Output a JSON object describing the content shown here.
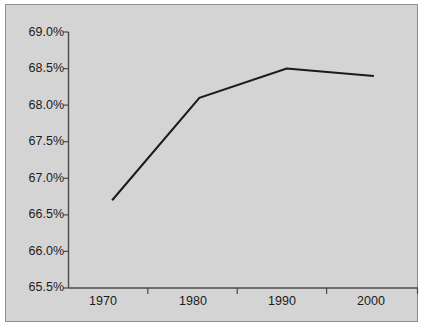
{
  "figure": {
    "background_color": "#ffffff",
    "panel_color": "#d4d4d4",
    "panel_border_color": "#8f8f8f",
    "title_partial": "",
    "axis_color": "#4a4a4a",
    "line_color": "#1a1a1a"
  },
  "chart_data": {
    "type": "line",
    "title": "",
    "xlabel": "",
    "ylabel": "",
    "categories": [
      "1970",
      "1980",
      "1990",
      "2000"
    ],
    "values": [
      66.7,
      68.1,
      68.5,
      68.4
    ],
    "value_labels": [
      "66.7%",
      "68.1%",
      "68.5%",
      "68.4%"
    ],
    "ylim": [
      65.5,
      69.0
    ],
    "yticks": [
      65.5,
      66.0,
      66.5,
      67.0,
      67.5,
      68.0,
      68.5,
      69.0
    ],
    "ytick_labels": [
      "65.5%",
      "66.0%",
      "66.5%",
      "67.0%",
      "67.5%",
      "68.0%",
      "68.5%",
      "69.0%"
    ],
    "xtick_labels": [
      "1970",
      "1980",
      "1990",
      "2000"
    ],
    "grid": false,
    "legend": false,
    "series": [
      {
        "name": "series-1",
        "values": [
          66.7,
          68.1,
          68.5,
          68.4
        ],
        "color": "#1a1a1a",
        "marker": "none",
        "line_width": 2
      }
    ]
  }
}
